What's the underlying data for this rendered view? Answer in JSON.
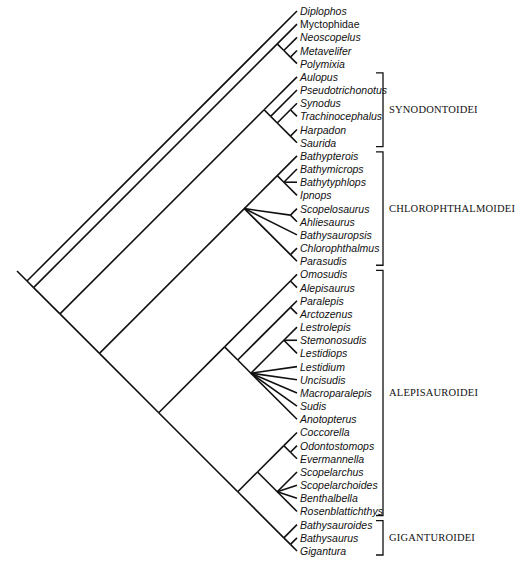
{
  "figure": {
    "type": "slanted cladogram",
    "line_color": "#111111",
    "background": "#ffffff"
  },
  "taxa": [
    {
      "name": "Diplophos",
      "italic": true
    },
    {
      "name": "Myctophidae",
      "italic": false
    },
    {
      "name": "Neoscopelus",
      "italic": true
    },
    {
      "name": "Metavelifer",
      "italic": true
    },
    {
      "name": "Polymixia",
      "italic": true
    },
    {
      "name": "Aulopus",
      "italic": true
    },
    {
      "name": "Pseudotrichonotus",
      "italic": true
    },
    {
      "name": "Synodus",
      "italic": true
    },
    {
      "name": "Trachinocephalus",
      "italic": true
    },
    {
      "name": "Harpadon",
      "italic": true
    },
    {
      "name": "Saurida",
      "italic": true
    },
    {
      "name": "Bathypterois",
      "italic": true
    },
    {
      "name": "Bathymicrops",
      "italic": true
    },
    {
      "name": "Bathytyphlops",
      "italic": true
    },
    {
      "name": "Ipnops",
      "italic": true
    },
    {
      "name": "Scopelosaurus",
      "italic": true
    },
    {
      "name": "Ahliesaurus",
      "italic": true
    },
    {
      "name": "Bathysauropsis",
      "italic": true
    },
    {
      "name": "Chlorophthalmus",
      "italic": true
    },
    {
      "name": "Parasudis",
      "italic": true
    },
    {
      "name": "Omosudis",
      "italic": true
    },
    {
      "name": "Alepisaurus",
      "italic": true
    },
    {
      "name": "Paralepis",
      "italic": true
    },
    {
      "name": "Arctozenus",
      "italic": true
    },
    {
      "name": "Lestrolepis",
      "italic": true
    },
    {
      "name": "Stemonosudis",
      "italic": true
    },
    {
      "name": "Lestidiops",
      "italic": true
    },
    {
      "name": "Lestidium",
      "italic": true
    },
    {
      "name": "Uncisudis",
      "italic": true
    },
    {
      "name": "Macroparalepis",
      "italic": true
    },
    {
      "name": "Sudis",
      "italic": true
    },
    {
      "name": "Anotopterus",
      "italic": true
    },
    {
      "name": "Coccorella",
      "italic": true
    },
    {
      "name": "Odontostomops",
      "italic": true
    },
    {
      "name": "Evermannella",
      "italic": true
    },
    {
      "name": "Scopelarchus",
      "italic": true
    },
    {
      "name": "Scopelarchoides",
      "italic": true
    },
    {
      "name": "Benthalbella",
      "italic": true
    },
    {
      "name": "Rosenblattichthys",
      "italic": true
    },
    {
      "name": "Bathysauroides",
      "italic": true
    },
    {
      "name": "Bathysaurus",
      "italic": true
    },
    {
      "name": "Gigantura",
      "italic": true
    }
  ],
  "tree": [
    0,
    [
      [
        1,
        [
          2,
          [
            3,
            4
          ]
        ]
      ],
      [
        [
          5,
          [
            6,
            [
              [
                7,
                8
              ],
              [
                9,
                10
              ]
            ]
          ]
        ],
        [
          [
            [
              11,
              [
                12,
                13,
                14
              ]
            ],
            [
              15,
              16
            ],
            17,
            [
              18,
              19
            ]
          ],
          [
            [
              [
                20,
                21
              ],
              [
                [
                  22,
                  23
                ],
                [
                  [
                    24,
                    25,
                    26
                  ],
                  27,
                  28,
                  29,
                  30,
                  31
                ]
              ]
            ],
            [
              [
                [
                  32,
                  [
                    33,
                    34
                  ]
                ],
                [
                  35,
                  36,
                  37,
                  38
                ]
              ],
              [
                39,
                [
                  40,
                  41
                ]
              ]
            ]
          ]
        ]
      ]
    ]
  ],
  "groups": [
    {
      "label": "SYNODONTOIDEI",
      "from": 5,
      "to": 10
    },
    {
      "label": "CHLOROPHTHALMOIDEI",
      "from": 11,
      "to": 19
    },
    {
      "label": "ALEPISAUROIDEI",
      "from": 20,
      "to": 38
    },
    {
      "label": "GIGANTUROIDEI",
      "from": 39,
      "to": 41
    }
  ]
}
